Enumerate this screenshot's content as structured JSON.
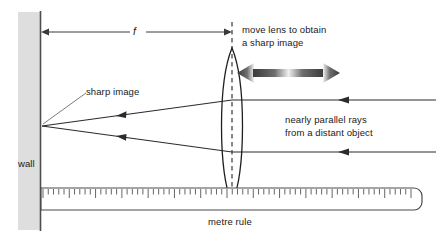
{
  "diagram": {
    "type": "ray-optics-diagram",
    "colors": {
      "ink": "#1a1a1a",
      "wall_fill": "#dedede",
      "wall_edge": "#5a5a5a",
      "ray": "#333333",
      "ruler_outline": "#4a4a4a",
      "ruler_fill": "#ffffff",
      "arrow_dark": "#3a3a3a",
      "arrow_light": "#f2f2f2"
    },
    "labels": {
      "wall": "wall",
      "focal_length": "f",
      "sharp_image": "sharp image",
      "move_lens_line1": "move lens to obtain",
      "move_lens_line2": "a sharp image",
      "parallel_rays_line1": "nearly parallel rays",
      "parallel_rays_line2": "from a distant object",
      "metre_rule": "metre rule"
    },
    "geometry": {
      "wall": {
        "x": 18,
        "y": 12,
        "width": 22,
        "height": 218,
        "edge_x": 40.5
      },
      "focal_dimension": {
        "y": 32,
        "x_start": 41,
        "x_end": 232
      },
      "lens": {
        "cx": 232,
        "cy": 126,
        "half_height": 78,
        "half_width": 13
      },
      "focal_point": {
        "x": 42,
        "y": 126
      },
      "converging_rays": [
        {
          "from_x": 232,
          "from_y": 100,
          "to_x": 42,
          "to_y": 126,
          "arrow_x": 120
        },
        {
          "from_x": 232,
          "from_y": 152,
          "to_x": 42,
          "to_y": 126,
          "arrow_x": 120
        }
      ],
      "parallel_rays": [
        {
          "y": 100,
          "x_start": 232,
          "x_end": 436,
          "arrow_x": 345
        },
        {
          "y": 152,
          "x_start": 232,
          "x_end": 436,
          "arrow_x": 345
        }
      ],
      "double_arrow": {
        "y": 73,
        "x_left": 237,
        "x_right": 340
      },
      "ruler": {
        "x": 41,
        "y": 188,
        "width": 384,
        "height": 22,
        "tick_count": 70
      },
      "leader_line": {
        "x1": 86,
        "y1": 93,
        "x2": 43,
        "y2": 124
      }
    }
  }
}
